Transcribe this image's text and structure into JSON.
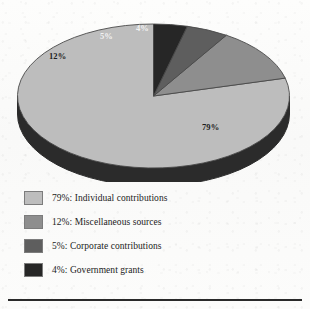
{
  "chart_title": "",
  "chart_data": {
    "type": "pie",
    "title": "",
    "subtitle": "",
    "xlabel": "",
    "ylabel": "",
    "legend_position": "bottom-left",
    "grid": false,
    "start_angle_deg": 90,
    "direction": "counterclockwise",
    "three_d": true,
    "categories": [
      "Individual contributions",
      "Miscellaneous sources",
      "Corporate contributions",
      "Government grants"
    ],
    "values": [
      79,
      12,
      5,
      4
    ],
    "value_labels": [
      "79%",
      "12%",
      "5%",
      "4%"
    ],
    "colors": [
      "#bdbdbd",
      "#8e8e8e",
      "#5e5e5e",
      "#262626"
    ],
    "slice_label_colors": [
      "#1d1d1d",
      "#1d1d1d",
      "#f2f2f2",
      "#f2f2f2"
    ],
    "depth_color": "#2b2b2b",
    "outline_color": "#4a4a4a"
  },
  "slice_labels": [
    {
      "text": "79%",
      "x": 202,
      "y": 118
    },
    {
      "text": "12%",
      "x": 49,
      "y": 47
    },
    {
      "text": "5%",
      "x": 100,
      "y": 27
    },
    {
      "text": "4%",
      "x": 136,
      "y": 19
    }
  ],
  "legend": {
    "rows": [
      {
        "swatch_color": "#bdbdbd",
        "text": "79%:  Individual contributions",
        "percent": "79%",
        "label": "Individual contributions",
        "top": 4
      },
      {
        "swatch_color": "#8e8e8e",
        "text": "12%:  Miscellaneous sources",
        "percent": "12%",
        "label": "Miscellaneous sources",
        "top": 28
      },
      {
        "swatch_color": "#5e5e5e",
        "text": "5%:  Corporate contributions",
        "percent": "5%",
        "label": "Corporate contributions",
        "top": 52
      },
      {
        "swatch_color": "#262626",
        "text": "4%:  Government grants",
        "percent": "4%",
        "label": "Government grants",
        "top": 76
      }
    ]
  }
}
